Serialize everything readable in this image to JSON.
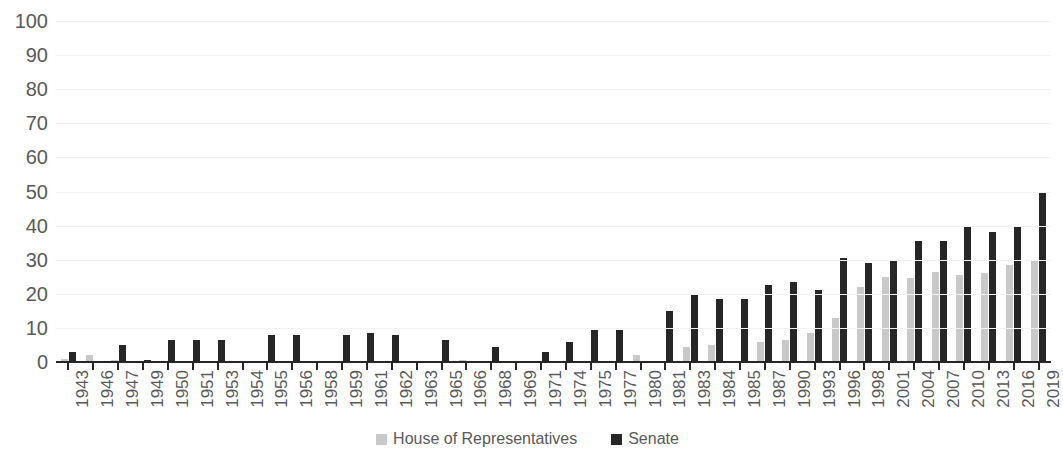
{
  "chart_data": {
    "type": "bar",
    "title": "",
    "subtitle": "",
    "xlabel": "",
    "ylabel": "",
    "ylim": [
      0,
      100
    ],
    "y_ticks": [
      0,
      10,
      20,
      30,
      40,
      50,
      60,
      70,
      80,
      90,
      100
    ],
    "grid": true,
    "legend_position": "bottom",
    "categories": [
      "1943",
      "1946",
      "1947",
      "1949",
      "1950",
      "1951",
      "1953",
      "1954",
      "1955",
      "1956",
      "1958",
      "1959",
      "1961",
      "1962",
      "1963",
      "1965",
      "1966",
      "1968",
      "1969",
      "1971",
      "1974",
      "1975",
      "1977",
      "1980",
      "1981",
      "1983",
      "1984",
      "1985",
      "1987",
      "1990",
      "1993",
      "1996",
      "1998",
      "2001",
      "2004",
      "2007",
      "2010",
      "2013",
      "2016",
      "2019"
    ],
    "series": [
      {
        "name": "House of Representatives",
        "color": "#c9c9c9",
        "values": [
          1,
          2,
          0.5,
          0,
          0,
          0,
          0,
          0,
          0,
          0,
          0,
          0,
          0,
          0,
          0,
          0,
          0.5,
          0,
          0,
          0,
          0,
          0,
          0,
          2,
          0,
          4.5,
          5,
          0,
          6,
          6.5,
          8.5,
          13,
          22,
          25,
          24.5,
          26.5,
          25.5,
          26,
          28.5,
          30
        ]
      },
      {
        "name": "Senate",
        "color": "#262626",
        "values": [
          3,
          0,
          5,
          0.5,
          6.5,
          6.5,
          6.5,
          0,
          8,
          8,
          0,
          8,
          8.5,
          8,
          0,
          6.5,
          0,
          4.5,
          0,
          3,
          6,
          9.5,
          9.5,
          0,
          15,
          20,
          18.5,
          18.5,
          22.5,
          23.5,
          21,
          30.5,
          29,
          30,
          35.5,
          35.5,
          39.5,
          38,
          39.5,
          49.5
        ]
      }
    ]
  },
  "legend": {
    "items": [
      {
        "label": "House of Representatives",
        "swatch": "house-legend-swatch"
      },
      {
        "label": "Senate",
        "swatch": "senate-legend-swatch"
      }
    ]
  }
}
